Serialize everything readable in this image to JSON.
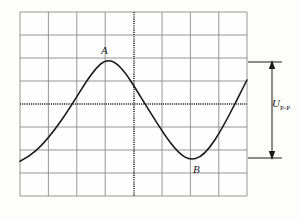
{
  "figure": {
    "background_color": "#fdfdfc",
    "grid_color": "#8a8a8a",
    "trace_color": "#1a1a1a",
    "axis_color": "#1a1a1a",
    "annotation_color": "#1a1a1a"
  },
  "graticule": {
    "name": "oscilloscope-graticule",
    "left": 20,
    "top": 12,
    "right": 247,
    "bottom": 196,
    "columns": 8,
    "rows": 8,
    "cell_width": 28.4,
    "cell_height": 23,
    "center_x": 134,
    "center_y": 104,
    "center_lines_style": "dotted"
  },
  "waveform": {
    "name": "sine-wave-trace",
    "type": "sine",
    "period_px": 170,
    "amplitude_px": 48,
    "baseline_y": 104,
    "crest_y": 62,
    "trough_y": 158,
    "crest_x": 108,
    "trough_x": 196,
    "phase_start_x": 20,
    "stroke_width": 1.6
  },
  "labels": {
    "crest": "A",
    "trough": "B",
    "peak_to_peak_symbol": "U",
    "peak_to_peak_subscript": "P-P"
  },
  "annotation": {
    "name": "peak-to-peak-dimension",
    "arrow_x": 272,
    "arrow_top_y": 62,
    "arrow_bottom_y": 158,
    "tick_left_x": 247,
    "tick_right_x": 282,
    "description": "Double headed vertical arrow spanning crest to trough"
  }
}
